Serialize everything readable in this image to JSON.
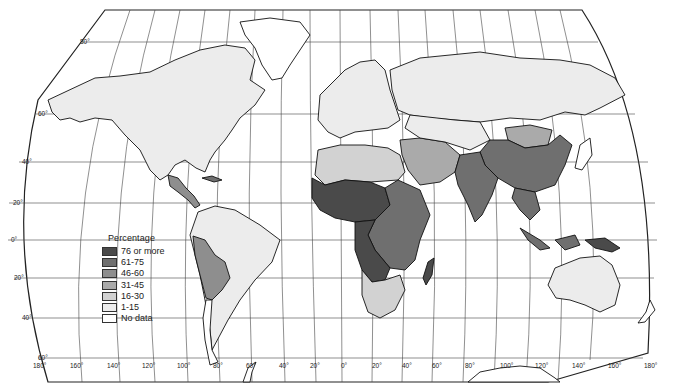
{
  "map": {
    "type": "choropleth",
    "projection": "Robinson-like world projection",
    "legend": {
      "title": "Percentage",
      "classes": [
        {
          "label": "76 or more",
          "color": "#4a4a4a"
        },
        {
          "label": "61-75",
          "color": "#6f6f6f"
        },
        {
          "label": "46-60",
          "color": "#8e8e8e"
        },
        {
          "label": "31-45",
          "color": "#aaaaaa"
        },
        {
          "label": "16-30",
          "color": "#d2d2d2"
        },
        {
          "label": "1-15",
          "color": "#ececec"
        },
        {
          "label": "No data",
          "color": "#ffffff"
        }
      ]
    },
    "latitude_labels": [
      "80°",
      "60°",
      "40°",
      "20°",
      "0°",
      "20°",
      "40°",
      "60°"
    ],
    "longitude_labels": [
      "180°",
      "160°",
      "140°",
      "120°",
      "100°",
      "80°",
      "60°",
      "40°",
      "20°",
      "0°",
      "20°",
      "40°",
      "60°",
      "80°",
      "100°",
      "120°",
      "140°",
      "160°",
      "180°"
    ],
    "regions": [
      {
        "name": "North America (USA/Canada)",
        "class": "1-15"
      },
      {
        "name": "Central America",
        "class": "46-60"
      },
      {
        "name": "Andean South America",
        "class": "46-60"
      },
      {
        "name": "Brazil",
        "class": "1-15"
      },
      {
        "name": "Europe",
        "class": "1-15"
      },
      {
        "name": "Russia",
        "class": "1-15"
      },
      {
        "name": "Sahel / West Africa",
        "class": "76 or more"
      },
      {
        "name": "Central & East Africa",
        "class": "61-75"
      },
      {
        "name": "Madagascar",
        "class": "76 or more"
      },
      {
        "name": "North Africa",
        "class": "16-30"
      },
      {
        "name": "Middle East",
        "class": "31-45"
      },
      {
        "name": "South Asia (India)",
        "class": "61-75"
      },
      {
        "name": "China",
        "class": "61-75"
      },
      {
        "name": "Mongolia",
        "class": "31-45"
      },
      {
        "name": "Southeast Asia",
        "class": "61-75"
      },
      {
        "name": "Papua New Guinea",
        "class": "76 or more"
      },
      {
        "name": "Australia",
        "class": "1-15"
      }
    ]
  }
}
